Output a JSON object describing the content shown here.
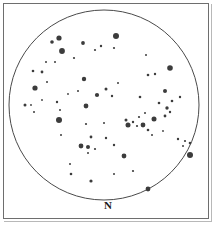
{
  "chart_data": {
    "type": "scatter",
    "title": "",
    "subtitle": "",
    "xlabel": "",
    "ylabel": "",
    "projection": "circular field of view",
    "grid": false,
    "legend_position": "none",
    "field": {
      "center_x": 104,
      "center_y": 105,
      "radius": 95,
      "outline_color": "#4a4a4a",
      "outline_width": 1,
      "background_color": "#ffffff"
    },
    "annotations": [
      {
        "name": "north-label",
        "text": "N",
        "x": 104,
        "y": 205
      }
    ],
    "star_color": "#3c3c3c",
    "series": [
      {
        "name": "stars",
        "marker": "filled-circle",
        "points": [
          {
            "x": 59,
            "y": 38,
            "r": 2.6
          },
          {
            "x": 52,
            "y": 42,
            "r": 1.8
          },
          {
            "x": 62,
            "y": 51,
            "r": 2.9
          },
          {
            "x": 116,
            "y": 36,
            "r": 3.0
          },
          {
            "x": 83,
            "y": 43,
            "r": 1.9
          },
          {
            "x": 95,
            "y": 50,
            "r": 1.1
          },
          {
            "x": 101,
            "y": 46,
            "r": 1.2
          },
          {
            "x": 114,
            "y": 48,
            "r": 1.1
          },
          {
            "x": 42,
            "y": 72,
            "r": 1.4
          },
          {
            "x": 55,
            "y": 62,
            "r": 1.0
          },
          {
            "x": 33,
            "y": 71,
            "r": 1.3
          },
          {
            "x": 35,
            "y": 88,
            "r": 2.6
          },
          {
            "x": 47,
            "y": 82,
            "r": 1.0
          },
          {
            "x": 84,
            "y": 79,
            "r": 2.2
          },
          {
            "x": 170,
            "y": 68,
            "r": 2.8
          },
          {
            "x": 148,
            "y": 75,
            "r": 1.3
          },
          {
            "x": 155,
            "y": 74,
            "r": 1.2
          },
          {
            "x": 106,
            "y": 89,
            "r": 1.5
          },
          {
            "x": 97,
            "y": 95,
            "r": 2.1
          },
          {
            "x": 112,
            "y": 96,
            "r": 1.2
          },
          {
            "x": 165,
            "y": 91,
            "r": 2.0
          },
          {
            "x": 140,
            "y": 97,
            "r": 1.3
          },
          {
            "x": 180,
            "y": 97,
            "r": 1.2
          },
          {
            "x": 25,
            "y": 105,
            "r": 1.5
          },
          {
            "x": 31,
            "y": 105,
            "r": 0.9
          },
          {
            "x": 57,
            "y": 102,
            "r": 1.2
          },
          {
            "x": 34,
            "y": 112,
            "r": 1.0
          },
          {
            "x": 60,
            "y": 110,
            "r": 1.0
          },
          {
            "x": 86,
            "y": 106,
            "r": 2.4
          },
          {
            "x": 159,
            "y": 103,
            "r": 1.3
          },
          {
            "x": 167,
            "y": 108,
            "r": 1.7
          },
          {
            "x": 172,
            "y": 101,
            "r": 1.3
          },
          {
            "x": 59,
            "y": 120,
            "r": 3.0
          },
          {
            "x": 86,
            "y": 124,
            "r": 1.1
          },
          {
            "x": 126,
            "y": 120,
            "r": 1.5
          },
          {
            "x": 133,
            "y": 122,
            "r": 1.2
          },
          {
            "x": 139,
            "y": 117,
            "r": 1.1
          },
          {
            "x": 145,
            "y": 113,
            "r": 1.0
          },
          {
            "x": 128,
            "y": 125,
            "r": 2.5
          },
          {
            "x": 137,
            "y": 126,
            "r": 1.1
          },
          {
            "x": 143,
            "y": 125,
            "r": 2.4
          },
          {
            "x": 154,
            "y": 119,
            "r": 2.5
          },
          {
            "x": 148,
            "y": 130,
            "r": 1.3
          },
          {
            "x": 165,
            "y": 116,
            "r": 1.4
          },
          {
            "x": 170,
            "y": 112,
            "r": 1.2
          },
          {
            "x": 104,
            "y": 123,
            "r": 1.0
          },
          {
            "x": 91,
            "y": 137,
            "r": 1.4
          },
          {
            "x": 106,
            "y": 138,
            "r": 1.2
          },
          {
            "x": 178,
            "y": 139,
            "r": 1.2
          },
          {
            "x": 185,
            "y": 141,
            "r": 1.1
          },
          {
            "x": 190,
            "y": 143,
            "r": 1.3
          },
          {
            "x": 183,
            "y": 146,
            "r": 1.0
          },
          {
            "x": 81,
            "y": 146,
            "r": 2.4
          },
          {
            "x": 88,
            "y": 147,
            "r": 2.0
          },
          {
            "x": 95,
            "y": 149,
            "r": 1.1
          },
          {
            "x": 114,
            "y": 145,
            "r": 1.2
          },
          {
            "x": 88,
            "y": 153,
            "r": 1.0
          },
          {
            "x": 190,
            "y": 155,
            "r": 3.0
          },
          {
            "x": 124,
            "y": 156,
            "r": 2.4
          },
          {
            "x": 70,
            "y": 164,
            "r": 1.0
          },
          {
            "x": 133,
            "y": 171,
            "r": 1.1
          },
          {
            "x": 71,
            "y": 174,
            "r": 1.3
          },
          {
            "x": 91,
            "y": 181,
            "r": 1.6
          },
          {
            "x": 148,
            "y": 189,
            "r": 2.4
          },
          {
            "x": 46,
            "y": 62,
            "r": 1.0
          },
          {
            "x": 74,
            "y": 58,
            "r": 1.1
          },
          {
            "x": 146,
            "y": 55,
            "r": 1.0
          },
          {
            "x": 78,
            "y": 91,
            "r": 1.0
          },
          {
            "x": 118,
            "y": 83,
            "r": 1.0
          },
          {
            "x": 152,
            "y": 135,
            "r": 1.0
          },
          {
            "x": 61,
            "y": 135,
            "r": 1.0
          },
          {
            "x": 114,
            "y": 174,
            "r": 1.0
          },
          {
            "x": 42,
            "y": 100,
            "r": 0.9
          },
          {
            "x": 68,
            "y": 94,
            "r": 0.9
          },
          {
            "x": 163,
            "y": 131,
            "r": 0.9
          }
        ]
      }
    ]
  },
  "frame": {
    "border_color": "#6e6e6e",
    "shadow_color": "#b8b8b8"
  }
}
